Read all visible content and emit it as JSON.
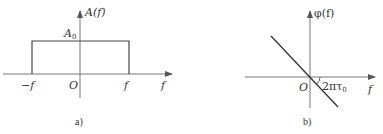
{
  "diagram_a": {
    "caption": "a)",
    "y_axis_label": "A(f)",
    "x_axis_label": "f",
    "origin_label": "O",
    "amplitude_label": "A",
    "amplitude_subscript": "0",
    "left_tick_label": "−f",
    "right_tick_label": "f",
    "shape": "rectangle"
  },
  "diagram_b": {
    "caption": "b)",
    "y_axis_label": "φ(f)",
    "x_axis_label": "f",
    "origin_label": "O",
    "slope_label": "2πτ",
    "slope_subscript": "0",
    "shape": "line-through-origin-negative-slope"
  },
  "colors": {
    "axis": "#6b6b6b",
    "line": "#333333",
    "text": "#333333"
  }
}
